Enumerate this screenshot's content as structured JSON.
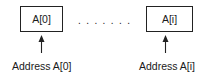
{
  "diagram": {
    "boxes": [
      {
        "label": "A[0]"
      },
      {
        "label": "A[i]"
      }
    ],
    "ellipsis": ".......",
    "addresses": [
      {
        "label": "Address A[0]"
      },
      {
        "label": "Address A[i]"
      }
    ]
  }
}
